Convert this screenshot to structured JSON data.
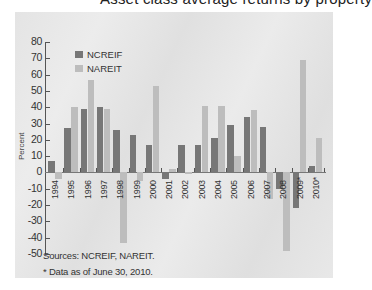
{
  "header": {
    "cut_title": "Asset class average returns by property"
  },
  "chart_data": {
    "type": "bar",
    "title": "",
    "xlabel": "",
    "ylabel": "Percent",
    "ylim": [
      -50,
      80
    ],
    "yticks": [
      80,
      70,
      60,
      50,
      40,
      30,
      20,
      10,
      0,
      -10,
      -20,
      -30,
      -40,
      -50
    ],
    "grid": false,
    "legend_position": "top-left",
    "categories": [
      "1994",
      "1995",
      "1996",
      "1997",
      "1998",
      "1999",
      "2000",
      "2001",
      "2002",
      "2003",
      "2004",
      "2005",
      "2006",
      "2007",
      "2008",
      "2009*",
      "2010*"
    ],
    "series": [
      {
        "name": "NCREIF",
        "color": "#777777",
        "values": [
          7,
          27,
          39,
          40,
          26,
          23,
          17,
          -4,
          17,
          17,
          21,
          29,
          34,
          28,
          -10,
          -22,
          4
        ]
      },
      {
        "name": "NAREIT",
        "color": "#bdbdbd",
        "values": [
          -4,
          40,
          57,
          39,
          -43,
          -5,
          53,
          2,
          -1,
          41,
          41,
          10,
          38,
          -16,
          -48,
          69,
          21
        ]
      }
    ],
    "notes": [
      "Sources: NCREIF, NAREIT.",
      "* Data as of June 30, 2010."
    ]
  },
  "colors": {
    "ncreif": "#777777",
    "nareit": "#bdbdbd",
    "panel": "#e6e6e6",
    "axis": "#555555"
  }
}
